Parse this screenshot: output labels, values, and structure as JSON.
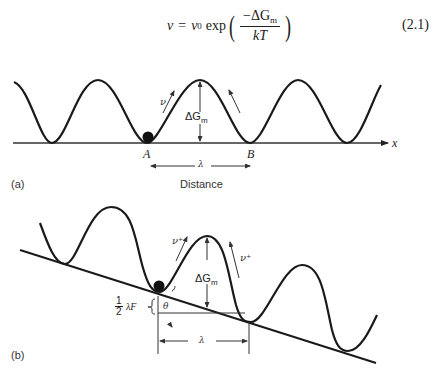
{
  "equation": {
    "lhs": "ν",
    "equals": "=",
    "prefactor": "ν",
    "prefactor_sub": "0",
    "function": "exp",
    "numerator": "−ΔG",
    "numerator_sub": "m",
    "denominator": "kT",
    "number": "(2.1)"
  },
  "panel_a": {
    "label": "(a)",
    "axis_label": "x",
    "xlabel": "Distance",
    "point_a": "A",
    "point_b": "B",
    "wavelength": "λ",
    "barrier": "ΔG",
    "barrier_sub": "m",
    "jump_frequency": "ν"
  },
  "panel_b": {
    "label": "(b)",
    "barrier": "ΔG",
    "barrier_sub": "m",
    "forward_frequency": "ν⁺",
    "backward_frequency": "ν⁺",
    "half_num": "1",
    "half_den": "2",
    "energy_shift": "λF",
    "angle": "θ",
    "wavelength": "λ"
  }
}
